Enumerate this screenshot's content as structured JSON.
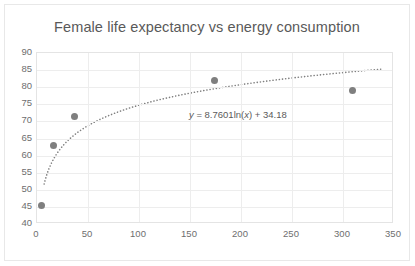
{
  "chart_data": {
    "type": "scatter",
    "title": "Female life expectancy vs energy consumption",
    "xlabel": "",
    "ylabel": "",
    "xlim": [
      0,
      350
    ],
    "ylim": [
      40,
      90
    ],
    "xticks": [
      0,
      50,
      100,
      150,
      200,
      250,
      300,
      350
    ],
    "yticks": [
      40,
      45,
      50,
      55,
      60,
      65,
      70,
      75,
      80,
      85,
      90
    ],
    "grid": true,
    "legend": false,
    "marker_color": "#7f7f7f",
    "trendline_color": "#808080",
    "points": [
      {
        "x": 4,
        "y": 45.5
      },
      {
        "x": 16,
        "y": 63.0
      },
      {
        "x": 37,
        "y": 71.5
      },
      {
        "x": 174,
        "y": 82.0
      },
      {
        "x": 309,
        "y": 79.0
      }
    ],
    "trendline": {
      "type": "logarithmic",
      "equation": "y = 8.7601ln(x) + 34.18",
      "coefficient": 8.7601,
      "intercept": 34.18,
      "style": "dotted",
      "x_start": 7,
      "x_end": 340
    },
    "annotations": [
      {
        "text": "y = 8.7601ln(x) + 34.18",
        "x": 150,
        "y": 71.5
      }
    ]
  }
}
